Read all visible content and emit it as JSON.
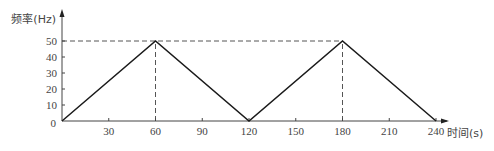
{
  "chart_data": {
    "type": "line",
    "title": "",
    "xlabel": "时间(s)",
    "ylabel": "频率(Hz)",
    "xlim": [
      0,
      240
    ],
    "ylim": [
      0,
      50
    ],
    "x_ticks": [
      30,
      60,
      90,
      120,
      150,
      180,
      210,
      240
    ],
    "y_ticks": [
      0,
      10,
      20,
      30,
      40,
      50
    ],
    "grid": false,
    "legend": null,
    "series": [
      {
        "name": "frequency",
        "x": [
          0,
          60,
          120,
          180,
          240
        ],
        "y": [
          0,
          50,
          0,
          50,
          0
        ]
      }
    ],
    "reference_lines": [
      {
        "type": "horizontal",
        "y": 50,
        "style": "dashed",
        "from_x": 0,
        "to_x": 180
      },
      {
        "type": "vertical",
        "x": 60,
        "style": "dashed"
      },
      {
        "type": "vertical",
        "x": 180,
        "style": "dashed"
      }
    ]
  }
}
